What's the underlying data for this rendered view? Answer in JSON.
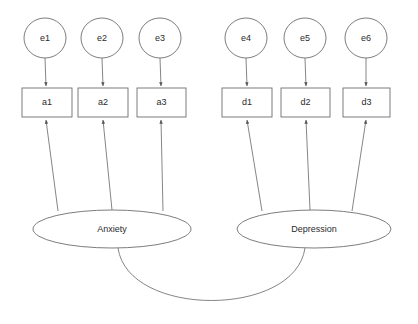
{
  "diagram": {
    "type": "structural-equation-model-path-diagram",
    "background_color": "#ffffff",
    "stroke_color": "#6e6e6e",
    "text_color": "#2b2b2b",
    "residuals": [
      {
        "id": "e1",
        "label": "e1",
        "cx": 45,
        "cy": 38,
        "rx": 21,
        "ry": 20
      },
      {
        "id": "e2",
        "label": "e2",
        "cx": 102,
        "cy": 38,
        "rx": 21,
        "ry": 20
      },
      {
        "id": "e3",
        "label": "e3",
        "cx": 160,
        "cy": 38,
        "rx": 21,
        "ry": 20
      },
      {
        "id": "e4",
        "label": "e4",
        "cx": 246,
        "cy": 38,
        "rx": 21,
        "ry": 20
      },
      {
        "id": "e5",
        "label": "e5",
        "cx": 305,
        "cy": 38,
        "rx": 21,
        "ry": 20
      },
      {
        "id": "e6",
        "label": "e6",
        "cx": 366,
        "cy": 38,
        "rx": 21,
        "ry": 20
      }
    ],
    "indicators": [
      {
        "id": "a1",
        "label": "a1",
        "x": 22,
        "y": 88,
        "w": 50,
        "h": 29
      },
      {
        "id": "a2",
        "label": "a2",
        "x": 78,
        "y": 88,
        "w": 50,
        "h": 29
      },
      {
        "id": "a3",
        "label": "a3",
        "x": 137,
        "y": 88,
        "w": 49,
        "h": 29
      },
      {
        "id": "d1",
        "label": "d1",
        "x": 222,
        "y": 88,
        "w": 50,
        "h": 29
      },
      {
        "id": "d2",
        "label": "d2",
        "x": 281,
        "y": 88,
        "w": 49,
        "h": 29
      },
      {
        "id": "d3",
        "label": "d3",
        "x": 343,
        "y": 88,
        "w": 47,
        "h": 29
      }
    ],
    "latents": [
      {
        "id": "anxiety",
        "label": "Anxiety",
        "cx": 112,
        "cy": 229,
        "rx": 79,
        "ry": 19
      },
      {
        "id": "depression",
        "label": "Depression",
        "cx": 314,
        "cy": 229,
        "rx": 77,
        "ry": 19
      }
    ],
    "residual_paths": [
      {
        "from": "e1",
        "to": "a1",
        "x1": 45,
        "y1": 58,
        "x2": 46,
        "y2": 86
      },
      {
        "from": "e2",
        "to": "a2",
        "x1": 102,
        "y1": 58,
        "x2": 103,
        "y2": 86
      },
      {
        "from": "e3",
        "to": "a3",
        "x1": 160,
        "y1": 58,
        "x2": 161,
        "y2": 86
      },
      {
        "from": "e4",
        "to": "d1",
        "x1": 246,
        "y1": 58,
        "x2": 247,
        "y2": 86
      },
      {
        "from": "e5",
        "to": "d2",
        "x1": 305,
        "y1": 58,
        "x2": 306,
        "y2": 86
      },
      {
        "from": "e6",
        "to": "d3",
        "x1": 366,
        "y1": 58,
        "x2": 366,
        "y2": 86
      }
    ],
    "loading_paths": [
      {
        "from": "anxiety",
        "to": "a1",
        "x1": 58,
        "y1": 211,
        "x2": 46,
        "y2": 120
      },
      {
        "from": "anxiety",
        "to": "a2",
        "x1": 112,
        "y1": 210,
        "x2": 103,
        "y2": 120
      },
      {
        "from": "anxiety",
        "to": "a3",
        "x1": 163,
        "y1": 211,
        "x2": 161,
        "y2": 120
      },
      {
        "from": "depression",
        "to": "d1",
        "x1": 262,
        "y1": 211,
        "x2": 247,
        "y2": 120
      },
      {
        "from": "depression",
        "to": "d2",
        "x1": 310,
        "y1": 210,
        "x2": 306,
        "y2": 120
      },
      {
        "from": "depression",
        "to": "d3",
        "x1": 352,
        "y1": 211,
        "x2": 366,
        "y2": 120
      }
    ],
    "covariance": {
      "between": [
        "anxiety",
        "depression"
      ],
      "path": "M 118 248 C 128 318, 295 318, 305 248"
    }
  }
}
